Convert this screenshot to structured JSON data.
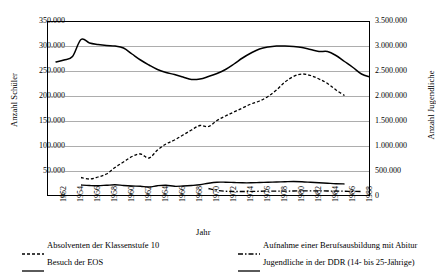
{
  "chart_data": {
    "type": "line",
    "title": "",
    "xlabel": "Jahr",
    "ylabel": "Anzahl Schüler",
    "ylabel_right": "Anzahl Jugendliche",
    "xlim": [
      1951,
      1989
    ],
    "ylim": [
      0,
      350000
    ],
    "ylim_right": [
      0,
      3500000
    ],
    "grid": true,
    "legend_position": "below",
    "x_tick_labels": [
      "1952",
      "1954",
      "1956",
      "1958",
      "1960",
      "1962",
      "1964",
      "1966",
      "1968",
      "1970",
      "1972",
      "1974",
      "1976",
      "1978",
      "1980",
      "1982",
      "1984",
      "1986",
      "1988"
    ],
    "x_tick_values": [
      1952,
      1954,
      1956,
      1958,
      1960,
      1962,
      1964,
      1966,
      1968,
      1970,
      1972,
      1974,
      1976,
      1978,
      1980,
      1982,
      1984,
      1986,
      1988
    ],
    "y_tick_labels_left": [
      "350.000",
      "300.000",
      "250.000",
      "200.000",
      "150.000",
      "100.000",
      "50.000",
      "0"
    ],
    "y_tick_values_left": [
      350000,
      300000,
      250000,
      200000,
      150000,
      100000,
      50000,
      0
    ],
    "y_tick_labels_right": [
      "3.500.000",
      "3.000.000",
      "2.500.000",
      "2.000.000",
      "1.500.000",
      "1.000.000",
      "500.000",
      "0"
    ],
    "y_tick_values_right": [
      3500000,
      3000000,
      2500000,
      2000000,
      1500000,
      1000000,
      500000,
      0
    ],
    "series": [
      {
        "name": "Absolventen der Klassenstufe 10",
        "axis": "left",
        "style": "dashed",
        "color": "#000000",
        "x": [
          1955,
          1956,
          1957,
          1958,
          1959,
          1960,
          1961,
          1962,
          1963,
          1964,
          1965,
          1966,
          1967,
          1968,
          1969,
          1970,
          1971,
          1972,
          1973,
          1974,
          1975,
          1976,
          1977,
          1978,
          1979,
          1980,
          1981,
          1982,
          1983,
          1984,
          1985,
          1986
        ],
        "y": [
          37000,
          34000,
          38000,
          44000,
          57000,
          68000,
          79000,
          84000,
          76000,
          92000,
          104000,
          112000,
          122000,
          132000,
          141000,
          139000,
          151000,
          160000,
          168000,
          176000,
          184000,
          190000,
          199000,
          212000,
          228000,
          239000,
          244000,
          241000,
          234000,
          225000,
          212000,
          201000
        ]
      },
      {
        "name": "Aufnahme einer Berufsausbildung mit Abitur",
        "axis": "left",
        "style": "dashdot",
        "color": "#000000",
        "x": [
          1970,
          1971,
          1972,
          1973,
          1974,
          1975,
          1976,
          1977,
          1978,
          1979,
          1980,
          1981,
          1982,
          1983,
          1984,
          1985,
          1986,
          1987,
          1988
        ],
        "y": [
          15000,
          11500,
          9500,
          9000,
          9000,
          9200,
          9500,
          9700,
          9800,
          9900,
          10000,
          10200,
          10300,
          10200,
          10000,
          9800,
          9500,
          9300,
          9000
        ]
      },
      {
        "name": "Besuch der EOS",
        "axis": "left",
        "style": "solid",
        "color": "#000000",
        "x": [
          1955,
          1956,
          1957,
          1958,
          1959,
          1960,
          1961,
          1962,
          1963,
          1964,
          1965,
          1966,
          1967,
          1968,
          1969,
          1970,
          1971,
          1972,
          1973,
          1974,
          1975,
          1976,
          1977,
          1978,
          1979,
          1980,
          1981,
          1982,
          1983,
          1984,
          1985,
          1986
        ],
        "y": [
          22000,
          21000,
          20500,
          21500,
          22500,
          21000,
          20000,
          19500,
          18000,
          20500,
          21500,
          19500,
          20000,
          21000,
          22500,
          25500,
          27500,
          27500,
          27000,
          26500,
          26500,
          27000,
          27500,
          28000,
          28500,
          29000,
          28500,
          27500,
          26500,
          25500,
          24500,
          24000
        ]
      },
      {
        "name": "Jugendliche in der DDR (14- bis 25-Jährige)",
        "axis": "right",
        "style": "solid",
        "color": "#000000",
        "x": [
          1952,
          1953,
          1954,
          1955,
          1956,
          1957,
          1958,
          1959,
          1960,
          1961,
          1962,
          1963,
          1964,
          1965,
          1966,
          1967,
          1968,
          1969,
          1970,
          1971,
          1972,
          1973,
          1974,
          1975,
          1976,
          1977,
          1978,
          1979,
          1980,
          1981,
          1982,
          1983,
          1984,
          1985,
          1986,
          1987,
          1988,
          1989
        ],
        "y": [
          2680000,
          2720000,
          2790000,
          3130000,
          3060000,
          3030000,
          3010000,
          3000000,
          2960000,
          2840000,
          2720000,
          2620000,
          2530000,
          2470000,
          2430000,
          2380000,
          2330000,
          2340000,
          2390000,
          2450000,
          2530000,
          2640000,
          2760000,
          2860000,
          2940000,
          2980000,
          3000000,
          3000000,
          2990000,
          2970000,
          2930000,
          2890000,
          2890000,
          2810000,
          2690000,
          2570000,
          2440000,
          2380000
        ]
      }
    ]
  },
  "legend": {
    "items": [
      {
        "label": "Absolventen der Klassenstufe 10",
        "style": "dashed"
      },
      {
        "label": "Aufnahme einer Berufsausbildung mit Abitur",
        "style": "dashdot"
      },
      {
        "label": "Besuch der EOS",
        "style": "solid"
      },
      {
        "label": "Jugendliche in der DDR (14- bis 25-Jährige)",
        "style": "solid"
      }
    ]
  }
}
